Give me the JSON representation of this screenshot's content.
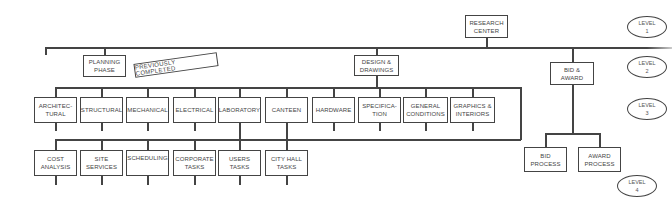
{
  "diagram": {
    "type": "org-chart",
    "root": {
      "label": "RESEARCH\nCENTER"
    },
    "level2": [
      {
        "label": "PLANNING\nPHASE",
        "annotation": "PREVIOUSLY COMPLETED"
      },
      {
        "label": "DESIGN &\nDRAWINGS"
      },
      {
        "label": "BID &\nAWARD"
      }
    ],
    "level3": [
      {
        "label": "ARCHITEC-\nTURAL"
      },
      {
        "label": "STRUCTURAL"
      },
      {
        "label": "MECHANICAL"
      },
      {
        "label": "ELECTRICAL"
      },
      {
        "label": "LABORATORY"
      },
      {
        "label": "CANTEEN"
      },
      {
        "label": "HARDWARE"
      },
      {
        "label": "SPECIFICA-\nTION"
      },
      {
        "label": "GENERAL\nCONDITIONS"
      },
      {
        "label": "GRAPHICS &\nINTERIORS"
      }
    ],
    "level4_design": [
      {
        "label": "COST\nANALYSIS"
      },
      {
        "label": "SITE\nSERVICES"
      },
      {
        "label": "SCHEDULING"
      },
      {
        "label": "CORPORATE\nTASKS"
      },
      {
        "label": "USERS\nTASKS"
      },
      {
        "label": "CITY HALL\nTASKS"
      }
    ],
    "level4_bid": [
      {
        "label": "BID\nPROCESS"
      },
      {
        "label": "AWARD\nPROCESS"
      }
    ],
    "levels": [
      {
        "label": "LEVEL\n1"
      },
      {
        "label": "LEVEL\n2"
      },
      {
        "label": "LEVEL\n3"
      },
      {
        "label": "LEVEL\n4"
      }
    ]
  }
}
